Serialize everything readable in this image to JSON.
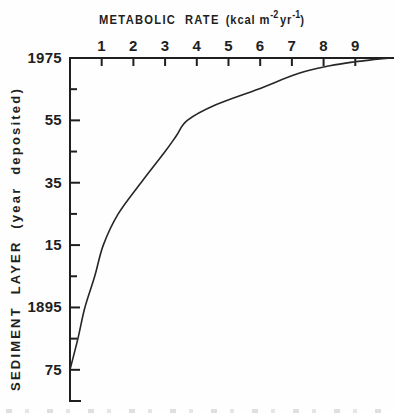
{
  "figure": {
    "background": "#fefefe",
    "ink_color": "#1f1f1f",
    "title": {
      "main": "METABOLIC RATE",
      "unit_open": "(kcal m",
      "sup_minus2": "-2",
      "unit_mid": "yr",
      "sup_minus1": "-1",
      "unit_close": ")"
    },
    "y_axis_title": "SEDIMENT LAYER (year deposited)"
  },
  "chart_data": {
    "type": "line",
    "xlabel": "METABOLIC RATE (kcal m-2 yr-1)",
    "ylabel": "SEDIMENT LAYER (year deposited)",
    "grid": false,
    "legend": false,
    "x_axis": {
      "position": "top",
      "range": [
        0,
        10.19
      ],
      "tick_values": [
        1,
        2,
        3,
        4,
        5,
        6,
        7,
        8,
        9
      ],
      "tick_labels": [
        "1",
        "2",
        "3",
        "4",
        "5",
        "6",
        "7",
        "8",
        "9"
      ]
    },
    "y_axis": {
      "position": "left",
      "top_year": 1975,
      "bottom_year": 1865,
      "major_ticks": [
        {
          "year": 1975,
          "label": "1975"
        },
        {
          "year": 1955,
          "label": "55"
        },
        {
          "year": 1935,
          "label": "35"
        },
        {
          "year": 1915,
          "label": "15"
        },
        {
          "year": 1895,
          "label": "1895"
        },
        {
          "year": 1875,
          "label": "75"
        }
      ],
      "minor_tick_years": [
        1965,
        1945,
        1925,
        1905,
        1885
      ],
      "end_tick_year": 1865
    },
    "series": [
      {
        "name": "sediment metabolic rate vs year deposited",
        "points_rate_year": [
          [
            0.0,
            1875
          ],
          [
            0.25,
            1885
          ],
          [
            0.47,
            1895
          ],
          [
            0.78,
            1905
          ],
          [
            1.05,
            1915
          ],
          [
            1.52,
            1925
          ],
          [
            2.24,
            1935
          ],
          [
            3.0,
            1945
          ],
          [
            3.35,
            1950
          ],
          [
            3.7,
            1955
          ],
          [
            4.6,
            1960
          ],
          [
            5.93,
            1965
          ],
          [
            7.2,
            1970
          ],
          [
            8.2,
            1972.5
          ],
          [
            9.0,
            1973.8
          ],
          [
            9.7,
            1974.6
          ],
          [
            10.12,
            1975
          ]
        ]
      }
    ]
  }
}
